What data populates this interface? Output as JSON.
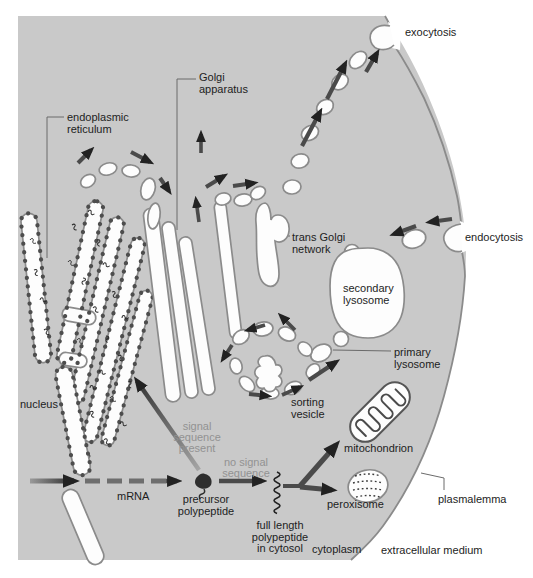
{
  "colors": {
    "background": "#ffffff",
    "cytoplasm_fill": "#c9c9c9",
    "membrane_stroke": "#8b8b8b",
    "organelle_fill": "#fdfdfd",
    "organelle_stroke": "#8b8b8b",
    "arrow": "#4a4a4a",
    "arrow_head": "#222222",
    "label_text": "#1d1d1d",
    "muted_label_text": "#929292"
  },
  "labels": {
    "exocytosis": "exocytosis",
    "endocytosis": "endocytosis",
    "golgi_apparatus": [
      "Golgi",
      "apparatus"
    ],
    "endoplasmic_reticulum": [
      "endoplasmic",
      "reticulum"
    ],
    "trans_golgi_network": [
      "trans Golgi",
      "network"
    ],
    "secondary_lysosome": [
      "secondary",
      "lysosome"
    ],
    "primary_lysosome": [
      "primary",
      "lysosome"
    ],
    "sorting_vesicle": [
      "sorting",
      "vesicle"
    ],
    "mitochondrion": "mitochondrion",
    "peroxisome": "peroxisome",
    "nucleus": "nucleus",
    "mrna": "mRNA",
    "precursor_polypeptide": [
      "precursor",
      "polypeptide"
    ],
    "signal_sequence_present": [
      "signal",
      "sequence",
      "present"
    ],
    "no_signal_sequence": [
      "no signal",
      "sequence"
    ],
    "full_length_polypeptide_in_cytosol": [
      "full length",
      "polypeptide",
      "in cytosol"
    ],
    "cytoplasm": "cytoplasm",
    "plasmalemma": "plasmalemma",
    "extracellular_medium": "extracellular medium"
  }
}
